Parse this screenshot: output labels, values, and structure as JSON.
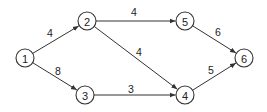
{
  "diagram": {
    "type": "directed-weighted-network",
    "nodes": [
      {
        "id": "1",
        "label": "1",
        "x": 25,
        "y": 58
      },
      {
        "id": "2",
        "label": "2",
        "x": 87,
        "y": 21
      },
      {
        "id": "3",
        "label": "3",
        "x": 85,
        "y": 95
      },
      {
        "id": "4",
        "label": "4",
        "x": 185,
        "y": 95
      },
      {
        "id": "5",
        "label": "5",
        "x": 185,
        "y": 21
      },
      {
        "id": "6",
        "label": "6",
        "x": 244,
        "y": 58
      }
    ],
    "edges": [
      {
        "from": "1",
        "to": "2",
        "weight": "4",
        "label_x": 50,
        "label_y": 33
      },
      {
        "from": "1",
        "to": "3",
        "weight": "8",
        "label_x": 58,
        "label_y": 71
      },
      {
        "from": "2",
        "to": "5",
        "weight": "4",
        "label_x": 134,
        "label_y": 12
      },
      {
        "from": "2",
        "to": "4",
        "weight": "4",
        "label_x": 139,
        "label_y": 52
      },
      {
        "from": "3",
        "to": "4",
        "weight": "3",
        "label_x": 131,
        "label_y": 89
      },
      {
        "from": "5",
        "to": "6",
        "weight": "6",
        "label_x": 218,
        "label_y": 32
      },
      {
        "from": "4",
        "to": "6",
        "weight": "5",
        "label_x": 211,
        "label_y": 70
      }
    ],
    "node_radius": 9,
    "colors": {
      "stroke": "#333333",
      "text": "#222222",
      "background": "#ffffff"
    }
  }
}
